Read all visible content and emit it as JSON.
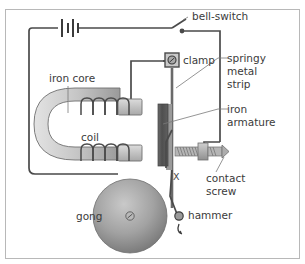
{
  "figure": {
    "border_color": "#b8b8b8",
    "background": "#ffffff"
  },
  "labels": {
    "bell_switch": "bell-switch",
    "clamp": "clamp",
    "springy": "springy",
    "metal": "metal",
    "strip": "strip",
    "iron": "iron",
    "armature": "armature",
    "iron_core": "iron core",
    "coil": "coil",
    "contact": "contact",
    "screw": "screw",
    "hammer": "hammer",
    "gong": "gong",
    "x_marker": "X"
  },
  "colors": {
    "wire": "#4a4a4a",
    "leader": "#7a7a7a",
    "text": "#3b3b3b",
    "core_light": "#d8d8d8",
    "core_dark": "#9a9a9a",
    "armature_dark": "#555555",
    "strip_gray": "#8f8f8f",
    "gong_outer": "#8a8a8a",
    "gong_inner": "#bdbdbd",
    "screw_body": "#a9a9a9",
    "battery": "#3b3b3b"
  },
  "components": {
    "battery": {
      "name": "battery",
      "plates": 4
    },
    "switch": {
      "name": "bell-switch",
      "state": "open"
    },
    "clamp": {
      "name": "clamp",
      "shape": "square-with-circle"
    },
    "electromagnet": {
      "name": "u-shaped-iron-core-with-coils",
      "coil_turns_top": 4,
      "coil_turns_bottom": 4
    },
    "armature": {
      "name": "iron-armature"
    },
    "contact_screw": {
      "name": "contact-screw",
      "threads": 9
    },
    "hammer": {
      "name": "hammer",
      "motion": "arrow-arc"
    },
    "gong": {
      "name": "gong",
      "shape": "disc",
      "center": "screw"
    }
  }
}
